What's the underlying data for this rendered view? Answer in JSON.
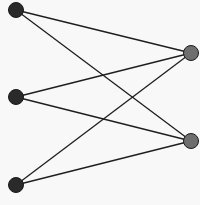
{
  "diagram": {
    "type": "bipartite-graph",
    "colors": {
      "background": "#f8f8f8",
      "edge": "#1e1e1e",
      "left_node": "#2a2a2a",
      "right_node": "#6e6e6e",
      "node_stroke": "#1a1a1a"
    },
    "left_nodes": [
      {
        "id": "L1",
        "x": 16,
        "y": 10
      },
      {
        "id": "L2",
        "x": 16,
        "y": 97
      },
      {
        "id": "L3",
        "x": 16,
        "y": 185
      }
    ],
    "right_nodes": [
      {
        "id": "R1",
        "x": 191,
        "y": 53
      },
      {
        "id": "R2",
        "x": 191,
        "y": 141
      }
    ],
    "edges": [
      [
        "L1",
        "R1"
      ],
      [
        "L1",
        "R2"
      ],
      [
        "L2",
        "R1"
      ],
      [
        "L2",
        "R2"
      ],
      [
        "L3",
        "R1"
      ],
      [
        "L3",
        "R2"
      ]
    ]
  }
}
